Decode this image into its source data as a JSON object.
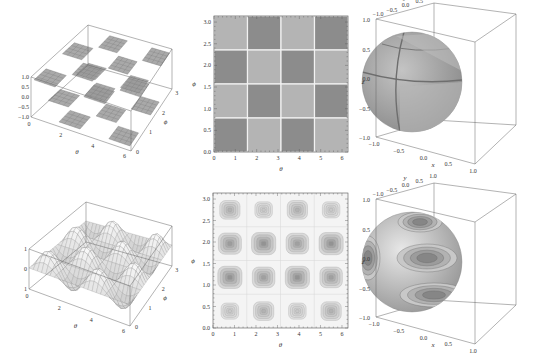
{
  "figure": {
    "panels": [
      {
        "id": "a",
        "kind": "3d-surface",
        "description": "piecewise checkerboard surface over theta-phi"
      },
      {
        "id": "b",
        "kind": "2d-density",
        "description": "checkerboard density plot"
      },
      {
        "id": "c",
        "kind": "3d-sphere",
        "description": "sphere colored by checkerboard"
      },
      {
        "id": "d",
        "kind": "3d-surface",
        "description": "smooth oscillating surface over theta-phi"
      },
      {
        "id": "e",
        "kind": "2d-contour",
        "description": "contour plot with 4x4 blobs"
      },
      {
        "id": "f",
        "kind": "3d-sphere",
        "description": "sphere with contour coloring"
      }
    ]
  },
  "labels": {
    "theta": "θ",
    "phi": "ϕ",
    "x": "x",
    "y": "y",
    "z": "z"
  },
  "ticks": {
    "theta": [
      "0",
      "1",
      "2",
      "3",
      "4",
      "5",
      "6"
    ],
    "theta3d": [
      "0",
      "2",
      "4",
      "6"
    ],
    "phi": [
      "0.0",
      "0.5",
      "1.0",
      "1.5",
      "2.0",
      "2.5",
      "3.0"
    ],
    "phi3d": [
      "0",
      "1",
      "2",
      "3"
    ],
    "z3d_top": [
      "1.0",
      "0.5",
      "0.0",
      "−0.5",
      "−1.0"
    ],
    "z3d_bottom": [
      "1",
      "0",
      "1"
    ],
    "sphere": [
      "−1.0",
      "−0.5",
      "0.0",
      "0.5",
      "1.0"
    ]
  },
  "chart_data": [
    {
      "type": "heatmap",
      "title": "",
      "xlabel": "θ",
      "ylabel": "ϕ",
      "xlim": [
        0,
        6.28
      ],
      "ylim": [
        0,
        3.14
      ],
      "x_ticks": [
        0,
        1,
        2,
        3,
        4,
        5,
        6
      ],
      "y_ticks": [
        0.0,
        0.5,
        1.0,
        1.5,
        2.0,
        2.5,
        3.0
      ],
      "grid": "4x4 checkerboard",
      "cells_top_to_bottom": [
        [
          "light",
          "dark",
          "light",
          "dark"
        ],
        [
          "dark",
          "light",
          "dark",
          "light"
        ],
        [
          "light",
          "dark",
          "light",
          "dark"
        ],
        [
          "dark",
          "light",
          "dark",
          "light"
        ]
      ],
      "colors": {
        "light": "#b4b4b4",
        "dark": "#8c8c8c"
      }
    },
    {
      "type": "heatmap",
      "title": "",
      "xlabel": "θ",
      "ylabel": "ϕ",
      "xlim": [
        0,
        6.28
      ],
      "ylim": [
        0,
        3.14
      ],
      "x_ticks": [
        0,
        1,
        2,
        3,
        4,
        5,
        6
      ],
      "y_ticks": [
        0.0,
        0.5,
        1.0,
        1.5,
        2.0,
        2.5,
        3.0
      ],
      "style": "contour",
      "blob_intensity_top_to_bottom": [
        [
          0.6,
          0.35,
          0.6,
          0.35
        ],
        [
          0.85,
          0.95,
          0.8,
          0.95
        ],
        [
          0.95,
          0.8,
          0.95,
          0.8
        ],
        [
          0.35,
          0.6,
          0.35,
          0.6
        ]
      ]
    }
  ]
}
